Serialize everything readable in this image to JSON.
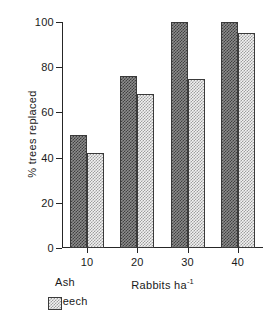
{
  "chart_data": {
    "type": "bar",
    "title": "",
    "xlabel": "Rabbits ha",
    "xlabel_sup": "-1",
    "ylabel": "% trees replaced",
    "categories": [
      "10",
      "20",
      "30",
      "40"
    ],
    "series": [
      {
        "name": "Ash",
        "values": [
          50,
          76,
          100,
          100
        ],
        "color": "#6e6e6e",
        "pattern": "dark-checker"
      },
      {
        "name": "Beech",
        "values": [
          42,
          68,
          75,
          95
        ],
        "color": "#e0e0e0",
        "pattern": "light-checker"
      }
    ],
    "ylim": [
      0,
      100
    ],
    "yticks": [
      0,
      20,
      40,
      60,
      80,
      100
    ],
    "grid": false,
    "legend_position": "below-left"
  }
}
